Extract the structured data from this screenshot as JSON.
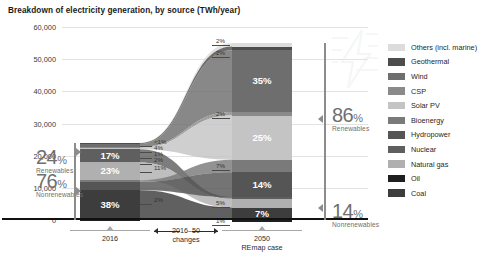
{
  "title": "Breakdown of electricity generation, by source (TWh/year)",
  "legend": {
    "items": [
      {
        "label": "Others (incl. marine)",
        "color": "#dcdcdc"
      },
      {
        "label": "Geothermal",
        "color": "#4d4d4d"
      },
      {
        "label": "Wind",
        "color": "#6e6e6e"
      },
      {
        "label": "CSP",
        "color": "#8a8a8a"
      },
      {
        "label": "Solar PV",
        "color": "#c4c4c4"
      },
      {
        "label": "Bioenergy",
        "color": "#7a7a7a"
      },
      {
        "label": "Hydropower",
        "color": "#555555"
      },
      {
        "label": "Nuclear",
        "color": "#5f5f5f"
      },
      {
        "label": "Natural gas",
        "color": "#b0b0b0"
      },
      {
        "label": "Oil",
        "color": "#1f1f1f"
      },
      {
        "label": "Coal",
        "color": "#3d3d3d"
      }
    ]
  },
  "axes": {
    "y_ticks": [
      "60,000",
      "50,000",
      "40,000",
      "30,000",
      "20,000",
      "10,000",
      "0"
    ],
    "y_max": 60000,
    "y_min": 0,
    "x_labels": [
      {
        "line1": "2016",
        "line2": ""
      },
      {
        "line1": "2016–50",
        "line2": "changes"
      },
      {
        "line1": "2050",
        "line2": "REmap case"
      }
    ]
  },
  "annotations": {
    "left_top": {
      "num": "24",
      "pc": "%",
      "cap": "Renewables"
    },
    "left_bottom": {
      "num": "76",
      "pc": "%",
      "cap": "Nonrenewables"
    },
    "right_top": {
      "num": "86",
      "pc": "%",
      "cap": "Renewables"
    },
    "right_bottom": {
      "num": "14",
      "pc": "%",
      "cap": "Nonrenewables"
    }
  },
  "chart_data": {
    "type": "bar",
    "title": "Breakdown of electricity generation, by source (TWh/year)",
    "xlabel": "",
    "ylabel": "TWh/year",
    "ylim": [
      0,
      60000
    ],
    "grid": true,
    "legend_position": "right",
    "categories": [
      "2016",
      "2050 REmap case"
    ],
    "totals_twh": [
      24000,
      55000
    ],
    "renewables_share_pct": [
      24,
      86
    ],
    "nonrenewables_share_pct": [
      76,
      14
    ],
    "series": [
      {
        "name": "Others (incl. marine)",
        "color": "#dcdcdc",
        "values": [
          0.5,
          2
        ],
        "labels": [
          "<1%",
          "2%"
        ]
      },
      {
        "name": "Geothermal",
        "color": "#4d4d4d",
        "values": [
          1,
          2
        ],
        "labels": [
          "1%",
          "2%"
        ]
      },
      {
        "name": "Wind",
        "color": "#6e6e6e",
        "values": [
          4,
          35
        ],
        "labels": [
          "4%",
          "35%"
        ]
      },
      {
        "name": "CSP",
        "color": "#8a8a8a",
        "values": [
          1,
          2
        ],
        "labels": [
          "1%",
          "2%"
        ]
      },
      {
        "name": "Solar PV",
        "color": "#c4c4c4",
        "values": [
          2,
          25
        ],
        "labels": [
          "2%",
          "25%"
        ]
      },
      {
        "name": "Bioenergy",
        "color": "#7a7a7a",
        "values": [
          2,
          7
        ],
        "labels": [
          "2%",
          "7%"
        ]
      },
      {
        "name": "Hydropower",
        "color": "#555555",
        "values": [
          11,
          14
        ],
        "labels": [
          "11%",
          "14%"
        ]
      },
      {
        "name": "Nuclear",
        "color": "#5f5f5f",
        "values": [
          17,
          1
        ],
        "labels": [
          "17%",
          "1%"
        ]
      },
      {
        "name": "Natural gas",
        "color": "#b0b0b0",
        "values": [
          23,
          5
        ],
        "labels": [
          "23%",
          "5%"
        ]
      },
      {
        "name": "Oil",
        "color": "#1f1f1f",
        "values": [
          2,
          1
        ],
        "labels": [
          "2%",
          "1%"
        ]
      },
      {
        "name": "Coal",
        "color": "#3d3d3d",
        "values": [
          38,
          7
        ],
        "labels": [
          "38%",
          "7%"
        ]
      }
    ]
  },
  "bar2016": {
    "segments": [
      {
        "name": "Others (incl. marine)",
        "pct": 0.5,
        "label": "<1%",
        "color": "#dcdcdc",
        "inside": false
      },
      {
        "name": "Geothermal",
        "pct": 1,
        "label": "1%",
        "color": "#4d4d4d",
        "inside": false
      },
      {
        "name": "Wind",
        "pct": 4,
        "label": "4%",
        "color": "#6e6e6e",
        "inside": false
      },
      {
        "name": "CSP",
        "pct": 1,
        "label": "1%",
        "color": "#8a8a8a",
        "inside": false
      },
      {
        "name": "Solar PV",
        "pct": 2,
        "label": "2%",
        "color": "#c4c4c4",
        "inside": false
      },
      {
        "name": "Nuclear",
        "pct": 17,
        "label": "17%",
        "color": "#5f5f5f",
        "inside": true
      },
      {
        "name": "Natural gas",
        "pct": 23,
        "label": "23%",
        "color": "#b0b0b0",
        "inside": true
      },
      {
        "name": "Bioenergy",
        "pct": 2,
        "label": "2%",
        "color": "#7a7a7a",
        "inside": false
      },
      {
        "name": "Hydropower",
        "pct": 11,
        "label": "11%",
        "color": "#555555",
        "inside": false
      },
      {
        "name": "Coal",
        "pct": 38,
        "label": "38%",
        "color": "#3d3d3d",
        "inside": true
      },
      {
        "name": "Oil",
        "pct": 2,
        "label": "2%",
        "color": "#1f1f1f",
        "inside": false
      }
    ]
  },
  "bar2050": {
    "segments": [
      {
        "name": "Others (incl. marine)",
        "pct": 2,
        "label": "2%",
        "color": "#dcdcdc",
        "inside": false
      },
      {
        "name": "Geothermal",
        "pct": 2,
        "label": "2%",
        "color": "#4d4d4d",
        "inside": false
      },
      {
        "name": "Wind",
        "pct": 35,
        "label": "35%",
        "color": "#6e6e6e",
        "inside": true
      },
      {
        "name": "CSP",
        "pct": 2,
        "label": "2%",
        "color": "#8a8a8a",
        "inside": false
      },
      {
        "name": "Solar PV",
        "pct": 25,
        "label": "25%",
        "color": "#c4c4c4",
        "inside": true
      },
      {
        "name": "Bioenergy",
        "pct": 7,
        "label": "7%",
        "color": "#7a7a7a",
        "inside": false
      },
      {
        "name": "Hydropower",
        "pct": 14,
        "label": "14%",
        "color": "#555555",
        "inside": true
      },
      {
        "name": "Nuclear",
        "pct": 1,
        "label": "1%",
        "color": "#5f5f5f",
        "inside": false
      },
      {
        "name": "Natural gas",
        "pct": 5,
        "label": "5%",
        "color": "#b0b0b0",
        "inside": false
      },
      {
        "name": "Coal",
        "pct": 7,
        "label": "7%",
        "color": "#3d3d3d",
        "inside": true
      },
      {
        "name": "Oil",
        "pct": 1,
        "label": "1%",
        "color": "#1f1f1f",
        "inside": false
      }
    ]
  }
}
